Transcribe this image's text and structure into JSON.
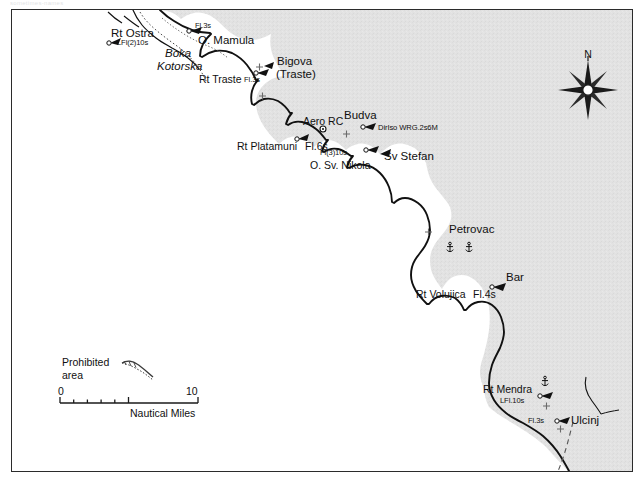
{
  "page": {
    "caption_faint": "sometimes-names",
    "background": "#ffffff"
  },
  "map": {
    "title_visible": false,
    "colors": {
      "land": "#e2e2e2",
      "sea": "#ffffff",
      "coastline": "#111111",
      "border_dashed": "#555555",
      "text": "#101010",
      "frame": "#2b2b2b"
    },
    "region": "Montenegro Adriatic coast",
    "compass": {
      "label": "N",
      "points": 8
    },
    "legend": {
      "prohibited_line1": "Prohibited",
      "prohibited_line2": "area",
      "scale_min": "0",
      "scale_max": "10",
      "scale_units": "Nautical Miles"
    },
    "labels": [
      {
        "name": "rt-ostra",
        "text": "Rt Ostra",
        "light": "LFl(2)10s",
        "x": 110,
        "y": 26,
        "style": "place",
        "align": "left"
      },
      {
        "name": "o-mamula",
        "text": "O. Mamula",
        "light": "Fl.3s",
        "x": 191,
        "y": 31,
        "style": "place",
        "align": "left"
      },
      {
        "name": "boka-kotorska",
        "text": "Boka Kotorska",
        "light": "",
        "x": 152,
        "y": 44,
        "style": "bay",
        "align": "left"
      },
      {
        "name": "rt-traste",
        "text": "Rt Traste",
        "light": "Fl.3s",
        "x": 196,
        "y": 70,
        "style": "place-sm",
        "align": "left"
      },
      {
        "name": "bigova-traste",
        "text": "Bigova (Traste)",
        "light": "",
        "x": 266,
        "y": 51,
        "style": "place",
        "align": "left"
      },
      {
        "name": "aero-rc",
        "text": "Aero RC",
        "light": "",
        "x": 296,
        "y": 112,
        "style": "place-sm",
        "align": "left"
      },
      {
        "name": "budva",
        "text": "Budva",
        "light": "",
        "x": 333,
        "y": 104,
        "style": "place",
        "align": "left"
      },
      {
        "name": "diriso",
        "text": "DirIso WRG.2s6M",
        "light": "",
        "x": 366,
        "y": 118,
        "style": "light",
        "align": "left"
      },
      {
        "name": "rt-platamuni",
        "text": "Rt Platamuni",
        "light": "Fl.6s",
        "x": 232,
        "y": 136,
        "style": "place-sm",
        "align": "left"
      },
      {
        "name": "o-sv-nikola",
        "text": "O. Sv. Nikola",
        "light": "Fl(3)10s",
        "x": 305,
        "y": 155,
        "style": "place-sm",
        "align": "left"
      },
      {
        "name": "sv-stefan",
        "text": "Sv Stefan",
        "light": "",
        "x": 375,
        "y": 146,
        "style": "place",
        "align": "left"
      },
      {
        "name": "petrovac",
        "text": "Petrovac",
        "light": "",
        "x": 442,
        "y": 220,
        "style": "place",
        "align": "left"
      },
      {
        "name": "bar",
        "text": "Bar",
        "light": "",
        "x": 498,
        "y": 267,
        "style": "place",
        "align": "left"
      },
      {
        "name": "rt-volujica",
        "text": "Rt Volujica",
        "light": "Fl.4s",
        "x": 408,
        "y": 284,
        "style": "place-sm",
        "align": "left"
      },
      {
        "name": "rt-mendra",
        "text": "Rt Mendra",
        "light": "LFl.10s",
        "x": 480,
        "y": 382,
        "style": "place-sm",
        "align": "left"
      },
      {
        "name": "ulcinj",
        "text": "Ulcinj",
        "light": "Fl.3s",
        "x": 570,
        "y": 414,
        "style": "place",
        "align": "left"
      }
    ]
  }
}
